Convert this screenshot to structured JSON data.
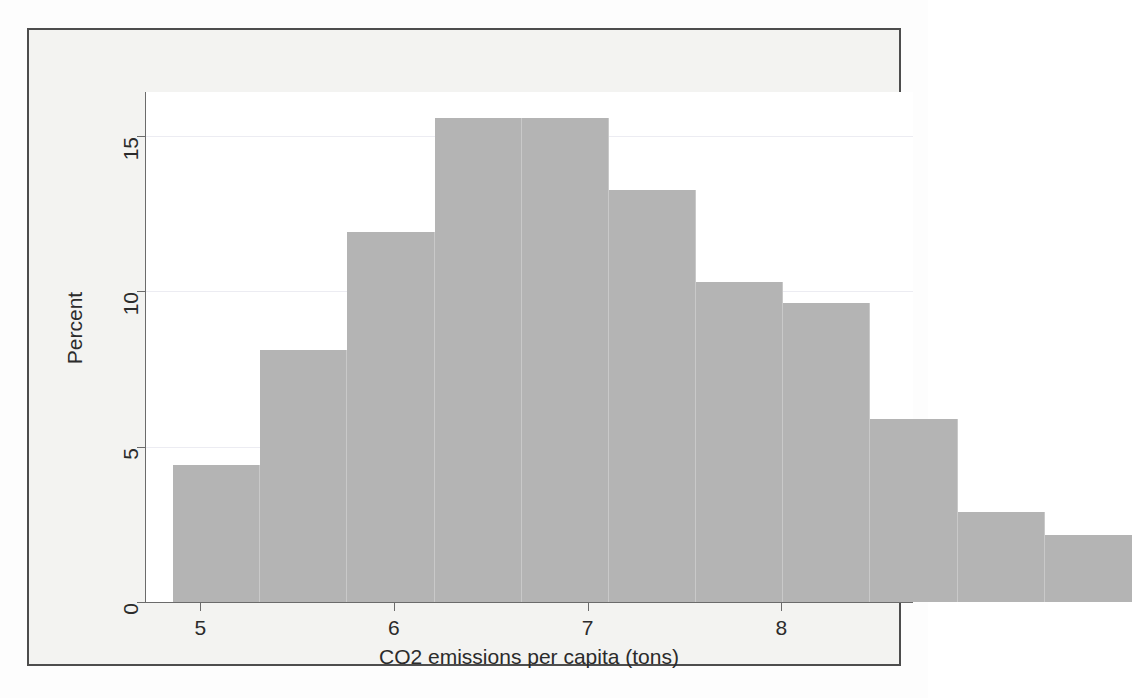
{
  "figure": {
    "background_color": "#f3f3f1",
    "plot_background_color": "#ffffff",
    "frame_color": "#4d4d4d",
    "bar_color": "#b4b4b4",
    "gridline_color": "#ececf2",
    "axis_color": "#6b6b6b"
  },
  "chart_data": {
    "type": "bar",
    "title": "",
    "subtitle": "",
    "xlabel": "CO2 emissions per capita (tons)",
    "ylabel": "Percent",
    "xlim": [
      4.72,
      8.68
    ],
    "ylim": [
      0,
      16.4
    ],
    "xticks": [
      5,
      6,
      7,
      8
    ],
    "xtick_labels": [
      "5",
      "6",
      "7",
      "8"
    ],
    "yticks": [
      0,
      5,
      10,
      15
    ],
    "ytick_labels": [
      "0",
      "5",
      "10",
      "15"
    ],
    "grid": "horizontal",
    "legend": "none",
    "annotations": [],
    "bin_width": 0.45,
    "bin_edges": [
      4.86,
      5.31,
      5.76,
      6.21,
      6.66,
      7.11,
      7.56,
      8.01,
      8.46
    ],
    "bin_starts": [
      4.86,
      5.31,
      5.76,
      6.21,
      6.66,
      7.11,
      7.56,
      8.01,
      8.46,
      8.91,
      9.36
    ],
    "categories": [
      "4.86-5.31",
      "5.31-5.76",
      "5.76-6.21",
      "6.21-6.66",
      "6.66-7.11",
      "7.11-7.56",
      "7.56-8.01",
      "8.01-8.46",
      "8.46-8.91",
      "8.91-9.36",
      "9.36-9.81"
    ],
    "values": [
      4.4,
      8.1,
      11.9,
      15.55,
      15.55,
      13.25,
      10.3,
      9.6,
      5.9,
      2.9,
      2.15
    ],
    "bars": [
      {
        "index": 1,
        "x_left": 4.86,
        "x_right": 5.31,
        "percent": 4.4
      },
      {
        "index": 2,
        "x_left": 5.31,
        "x_right": 5.76,
        "percent": 8.1
      },
      {
        "index": 3,
        "x_left": 5.76,
        "x_right": 6.21,
        "percent": 11.9
      },
      {
        "index": 4,
        "x_left": 6.21,
        "x_right": 6.66,
        "percent": 15.55
      },
      {
        "index": 5,
        "x_left": 6.66,
        "x_right": 7.11,
        "percent": 15.55
      },
      {
        "index": 6,
        "x_left": 7.11,
        "x_right": 7.56,
        "percent": 13.25
      },
      {
        "index": 7,
        "x_left": 7.56,
        "x_right": 8.01,
        "percent": 10.3
      },
      {
        "index": 8,
        "x_left": 8.01,
        "x_right": 8.46,
        "percent": 9.6
      },
      {
        "index": 9,
        "x_left": 8.46,
        "x_right": 8.91,
        "percent": 5.9
      },
      {
        "index": 10,
        "x_left": 8.91,
        "x_right": 9.36,
        "percent": 2.9
      },
      {
        "index": 11,
        "x_left": 9.36,
        "x_right": 9.81,
        "percent": 2.15
      }
    ]
  }
}
